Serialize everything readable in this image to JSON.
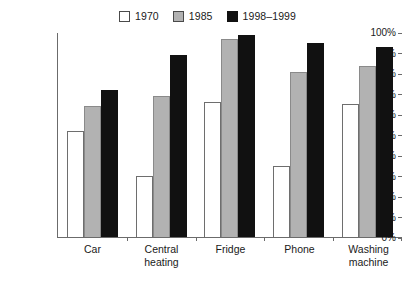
{
  "chart_data": {
    "type": "bar",
    "title": "",
    "subtitle": "",
    "xlabel": "",
    "ylabel": "",
    "ylim": [
      0,
      100
    ],
    "yticks": [
      "0%",
      "10%",
      "20%",
      "30%",
      "40%",
      "50%",
      "60%",
      "70%",
      "80%",
      "90%",
      "100%"
    ],
    "ytick_values": [
      0,
      10,
      20,
      30,
      40,
      50,
      60,
      70,
      80,
      90,
      100
    ],
    "grid": false,
    "legend_position": "top-center",
    "categories": [
      "Car",
      "Central\nheating",
      "Fridge",
      "Phone",
      "Washing\nmachine"
    ],
    "category_labels_flat": [
      "Car",
      "Central heating",
      "Fridge",
      "Phone",
      "Washing machine"
    ],
    "series": [
      {
        "name": "1970",
        "color": "#ffffff",
        "border_color": "#6e6e6e",
        "values": [
          52,
          30,
          66,
          35,
          65
        ]
      },
      {
        "name": "1985",
        "color": "#b2b2b2",
        "border_color": "#8a8a8a",
        "values": [
          64,
          69,
          97,
          81,
          84
        ]
      },
      {
        "name": "1998–1999",
        "color": "#111111",
        "border_color": "#111111",
        "values": [
          72,
          89,
          99,
          95,
          93
        ]
      }
    ],
    "axis_color": "#6b6b6b",
    "unit": "%"
  }
}
